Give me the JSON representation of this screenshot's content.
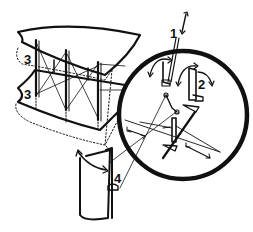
{
  "diagram": {
    "colors": {
      "ink": "#111111",
      "background": "#ffffff"
    },
    "labels": [
      {
        "id": "1",
        "text": "1",
        "x": 172,
        "y": 28
      },
      {
        "id": "2",
        "text": "2",
        "x": 198,
        "y": 78
      },
      {
        "id": "3a",
        "text": "3",
        "x": 24,
        "y": 54
      },
      {
        "id": "3b",
        "text": "3",
        "x": 24,
        "y": 88
      },
      {
        "id": "4",
        "text": "4",
        "x": 116,
        "y": 172
      }
    ]
  }
}
